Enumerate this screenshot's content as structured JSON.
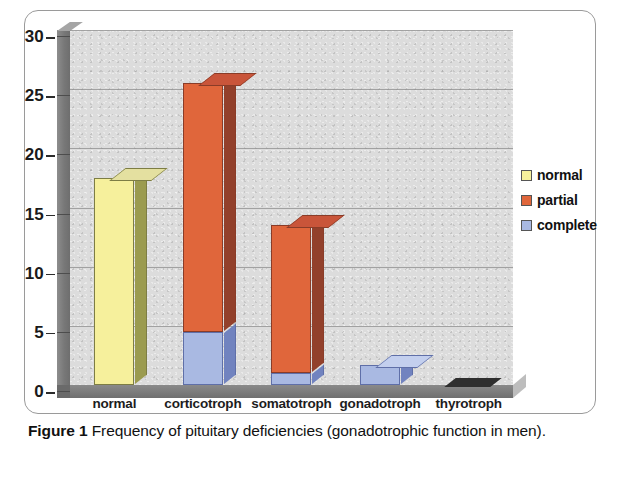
{
  "caption": {
    "bold_prefix": "Figure 1",
    "text": " Frequency of pituitary deficiencies (gonadotrophic function in men)."
  },
  "legend": {
    "position": "right",
    "items": [
      {
        "label": "normal",
        "color": "#f6f09c"
      },
      {
        "label": "partial",
        "color": "#e0663b"
      },
      {
        "label": "complete",
        "color": "#a9b9e2"
      }
    ]
  },
  "axes": {
    "y_ticks": [
      "30",
      "25",
      "20",
      "15",
      "10",
      "5",
      "0"
    ],
    "x_ticks": [
      "normal",
      "corticotroph",
      "somatotroph",
      "gonadotroph",
      "thyrotroph"
    ]
  },
  "chart_data": {
    "type": "bar",
    "title": "Frequency of pituitary deficiencies (gonadotrophic function in men)",
    "subtitle": "",
    "xlabel": "",
    "ylabel": "",
    "ylim": [
      0,
      30
    ],
    "ytick_interval": 5,
    "grid": true,
    "stacked": true,
    "three_d": true,
    "legend_position": "right",
    "categories": [
      "normal",
      "corticotroph",
      "somatotroph",
      "gonadotroph",
      "thyrotroph"
    ],
    "series": [
      {
        "name": "normal",
        "color": "#f6f09c",
        "values": [
          17.5,
          0,
          0,
          0,
          0
        ]
      },
      {
        "name": "partial",
        "color": "#e0663b",
        "values": [
          0,
          21,
          12.5,
          0,
          0
        ]
      },
      {
        "name": "complete",
        "color": "#a9b9e2",
        "values": [
          0,
          4.5,
          1,
          1.7,
          0
        ]
      }
    ],
    "totals": [
      17.5,
      25.5,
      13.5,
      1.7,
      0
    ]
  },
  "colors": {
    "plot_background": "#dcdcdc",
    "floor": "#7a7a7a",
    "gridline": "#8e8e8e",
    "yellow_face": "#f6f09c",
    "yellow_side": "#9b9b4f",
    "yellow_top": "#e4e0a0",
    "orange_face": "#e0663b",
    "orange_side": "#92402b",
    "orange_top": "#c8estub",
    "blue_face": "#a9b9e2",
    "blue_side": "#7183bf",
    "blue_top": "#c3cfee"
  }
}
